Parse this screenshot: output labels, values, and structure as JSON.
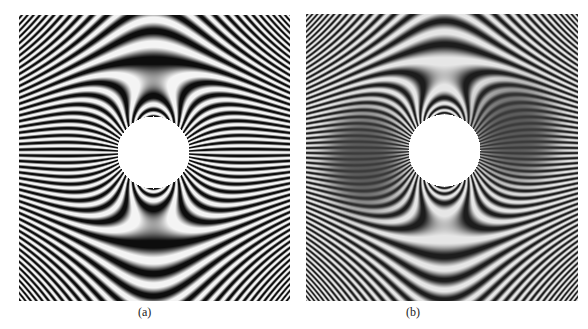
{
  "figure": {
    "background": "#ffffff",
    "panels": [
      {
        "id": "a",
        "label": "(a)",
        "box": {
          "x": 19,
          "y": 15,
          "w": 271,
          "h": 286
        },
        "label_pos": {
          "x": 138,
          "y": 305
        },
        "hole": {
          "cx": 134,
          "cy": 137,
          "r": 36
        },
        "fringe_strength": 5200,
        "fringe_spacing": 8.6,
        "dark_color": "#0d0d0d",
        "light_color": "#f4f4f4",
        "stripe_contrast": 1.0,
        "dark_lobes": []
      },
      {
        "id": "b",
        "label": "(b)",
        "box": {
          "x": 306,
          "y": 14,
          "w": 272,
          "h": 287
        },
        "label_pos": {
          "x": 406,
          "y": 305
        },
        "hole": {
          "cx": 138,
          "cy": 136,
          "r": 36
        },
        "fringe_strength": 5600,
        "fringe_spacing": 7.6,
        "dark_color": "#1c1c1c",
        "light_color": "#e6e6e6",
        "stripe_contrast": 0.9,
        "dark_lobes": [
          {
            "cx": 58,
            "cy": 145,
            "rx": 42,
            "ry": 56,
            "strength": 0.85
          },
          {
            "cx": 208,
            "cy": 118,
            "rx": 46,
            "ry": 52,
            "strength": 0.85
          }
        ]
      }
    ]
  }
}
